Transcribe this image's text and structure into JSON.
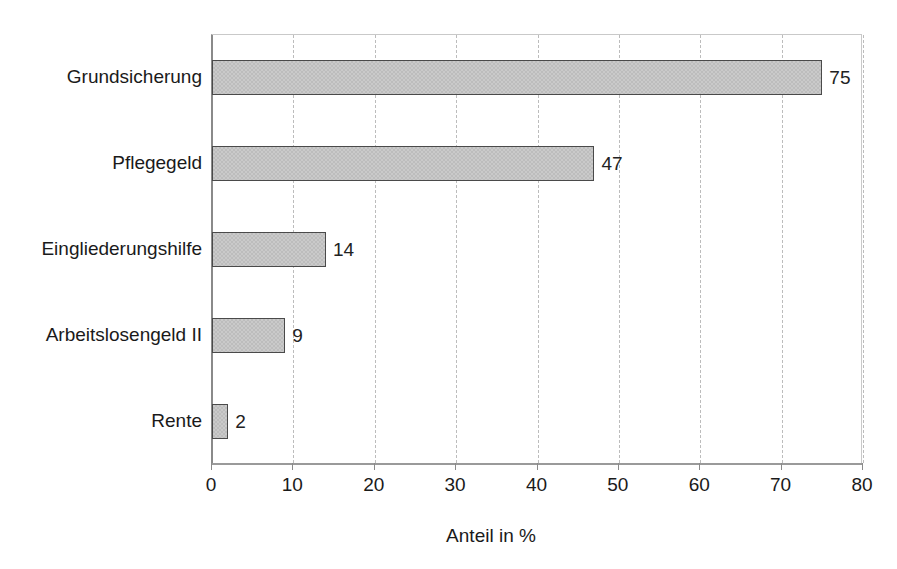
{
  "chart_data": {
    "type": "bar",
    "orientation": "horizontal",
    "title": "",
    "subtitle": "",
    "xlabel": "Anteil in %",
    "ylabel": "",
    "categories": [
      "Grundsicherung",
      "Pflegegeld",
      "Eingliederungshilfe",
      "Arbeitslosengeld II",
      "Rente"
    ],
    "values": [
      75,
      47,
      14,
      9,
      2
    ],
    "value_labels": [
      "75",
      "47",
      "14",
      "9",
      "2"
    ],
    "xlim": [
      0,
      80
    ],
    "xticks": [
      0,
      10,
      20,
      30,
      40,
      50,
      60,
      70,
      80
    ],
    "xtick_labels": [
      "0",
      "10",
      "20",
      "30",
      "40",
      "50",
      "60",
      "70",
      "80"
    ],
    "grid": "vertical-dashed",
    "legend": "none",
    "bar_fill_color": "#cacaca",
    "bar_border_color": "#4a4a4a",
    "gridline_color": "#bcbcbc",
    "axis_color": "#8a8a8a",
    "background_color": "#ffffff"
  }
}
